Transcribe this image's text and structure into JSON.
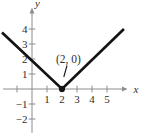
{
  "figure": {
    "colors": {
      "background": "#ffffff",
      "axis": "#8c8c8c",
      "line": "#141414",
      "text": "#2e2e2e"
    }
  },
  "chart_data": {
    "type": "line",
    "series": [
      {
        "name": "v-graph",
        "points": [
          [
            -2.0,
            3.77
          ],
          [
            2,
            0
          ],
          [
            6.13,
            4.0
          ]
        ]
      }
    ],
    "vertex_point": [
      2,
      0
    ],
    "annotation": {
      "text": "(2, 0)",
      "target": [
        2,
        0
      ]
    },
    "x_axis": {
      "label": "x",
      "ticks_labeled": [
        1,
        2,
        3,
        4,
        5
      ],
      "ticks_unlabeled": [
        -1
      ],
      "range": [
        -1.93,
        6.37
      ]
    },
    "y_axis": {
      "label": "y",
      "ticks_labeled": [
        -2,
        -1,
        1,
        2,
        3,
        4
      ],
      "ticks_unlabeled": [],
      "range": [
        -2.93,
        5.43
      ]
    },
    "grid": false,
    "legend": false
  }
}
